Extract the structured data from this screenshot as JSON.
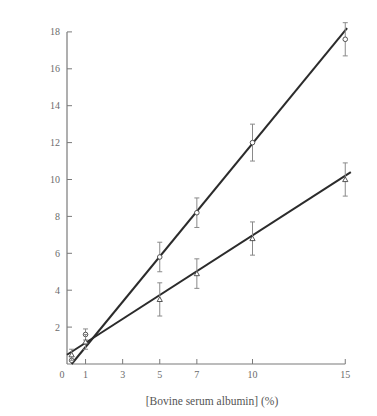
{
  "chart_data": {
    "type": "scatter",
    "title": "",
    "xlabel": "[Bovine serum albumin] (%)",
    "ylabel": "",
    "xlim": [
      0,
      15.5
    ],
    "ylim": [
      0,
      18.5
    ],
    "x_ticks": [
      0,
      1,
      3,
      5,
      7,
      10,
      15
    ],
    "y_ticks": [
      2,
      4,
      6,
      8,
      10,
      12,
      14,
      16,
      18
    ],
    "origin_label": "0",
    "grid": false,
    "legend": null,
    "series": [
      {
        "name": "upper (steep)",
        "marker": "open-circle",
        "x": [
          0.25,
          1,
          5,
          7,
          10,
          15
        ],
        "y": [
          0.2,
          1.6,
          5.8,
          8.2,
          12.0,
          17.6
        ],
        "err": [
          0.0,
          0.3,
          0.8,
          0.8,
          1.0,
          0.9
        ],
        "fit_line": {
          "x0": 0.25,
          "y0": 0.0,
          "x1": 15.1,
          "y1": 18.2
        }
      },
      {
        "name": "lower (shallow)",
        "marker": "open-triangle",
        "x": [
          0.25,
          1,
          5,
          7,
          10,
          15
        ],
        "y": [
          0.5,
          1.2,
          3.5,
          4.9,
          6.8,
          10.0
        ],
        "err": [
          0.3,
          0.4,
          0.9,
          0.8,
          0.9,
          0.9
        ],
        "fit_line": {
          "x0": 0.0,
          "y0": 0.5,
          "x1": 15.3,
          "y1": 10.4
        }
      }
    ]
  },
  "layout": {
    "origin_px": [
      67,
      364
    ],
    "x_px_per_unit": 18.55,
    "y_px_per_unit": 18.45,
    "axis_color": "#7a7a7a",
    "line_color": "#2b2b2b",
    "errbar_color": "#8a8a8a"
  }
}
